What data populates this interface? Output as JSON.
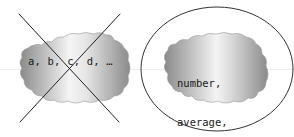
{
  "left_panel": {
    "text": "a, b, c, d, …",
    "status": "crossed-out"
  },
  "right_panel": {
    "lines": [
      "number,",
      "average,",
      "sum, …"
    ],
    "status": "circled"
  },
  "colors": {
    "cloud_dark": "#8c8c8c",
    "cloud_light": "#f2f2f2",
    "stroke": "#222222",
    "text": "#1a1a1a"
  }
}
